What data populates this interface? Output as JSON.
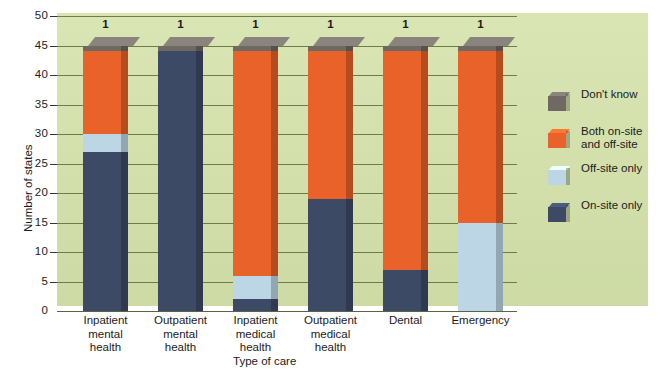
{
  "chart_data": {
    "type": "bar",
    "subtype": "stacked-bar",
    "title": "",
    "xlabel": "Type of care",
    "ylabel": "Number of states",
    "ylim": [
      0,
      50
    ],
    "ytick_step": 5,
    "yticks": [
      0,
      5,
      10,
      15,
      20,
      25,
      30,
      35,
      40,
      45,
      50
    ],
    "grid": true,
    "legend_position": "right",
    "categories": [
      "Inpatient mental health",
      "Outpatient mental health",
      "Inpatient medical health",
      "Outpatient medical health",
      "Dental",
      "Emergency"
    ],
    "category_lines": [
      [
        "Inpatient",
        "mental",
        "health"
      ],
      [
        "Outpatient",
        "mental",
        "health"
      ],
      [
        "Inpatient",
        "medical",
        "health"
      ],
      [
        "Outpatient",
        "medical",
        "health"
      ],
      [
        "Dental"
      ],
      [
        "Emergency"
      ]
    ],
    "series": [
      {
        "name": "On-site only",
        "color": "#3d4a66",
        "values": [
          27,
          44,
          2,
          19,
          7,
          0
        ]
      },
      {
        "name": "Off-site only",
        "color": "#bdd6e5",
        "values": [
          3,
          0,
          4,
          0,
          0,
          15
        ]
      },
      {
        "name": "Both on-site and off-site",
        "color": "#e8622a",
        "values": [
          14,
          0,
          38,
          25,
          37,
          29
        ]
      },
      {
        "name": "Don't know",
        "color": "#6e6a63",
        "values": [
          1,
          1,
          1,
          1,
          1,
          1
        ]
      }
    ],
    "totals": [
      45,
      45,
      45,
      45,
      45,
      45
    ]
  },
  "legend": {
    "items": [
      {
        "label": "Don't know",
        "color": "#6e6a63"
      },
      {
        "label": "Both on-site and off-site",
        "color": "#e8622a"
      },
      {
        "label": "Off-site only",
        "color": "#bdd6e5"
      },
      {
        "label": "On-site only",
        "color": "#3d4a66"
      }
    ]
  },
  "colors": {
    "background_panel": "#d5e3ab",
    "gridline": "#5d6a38",
    "on_site_only": "#3d4a66",
    "off_site_only": "#bdd6e5",
    "both_on_and_off_site": "#e8622a",
    "dont_know": "#6e6a63",
    "text": "#1b1b1b"
  }
}
